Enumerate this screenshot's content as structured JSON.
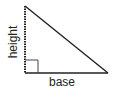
{
  "diagram": {
    "type": "right-triangle",
    "labels": {
      "height": "height",
      "base": "base"
    },
    "colors": {
      "stroke": "#222222",
      "background": "#ffffff"
    },
    "features": {
      "right_angle_marker": true,
      "height_side_style": "dotted"
    }
  }
}
